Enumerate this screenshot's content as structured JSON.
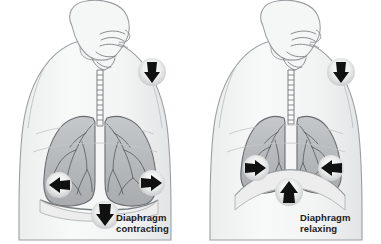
{
  "figure": {
    "background_color": "#ffffff"
  },
  "panels": [
    {
      "id": "inhalation",
      "caption_line1": "Diaphragm",
      "caption_line2": "contracting",
      "phase": "inhalation",
      "lung_state": "expanded",
      "diaphragm_state": "flattened / pulled down",
      "arrows": [
        {
          "name": "airflow-nose-arrow",
          "direction": "down",
          "meaning": "air flows in through nose and mouth"
        },
        {
          "name": "ribcage-left-arrow",
          "direction": "left",
          "meaning": "chest wall moves outward"
        },
        {
          "name": "ribcage-right-arrow",
          "direction": "right",
          "meaning": "chest wall moves outward"
        },
        {
          "name": "diaphragm-arrow",
          "direction": "down",
          "meaning": "diaphragm moves downward"
        }
      ]
    },
    {
      "id": "exhalation",
      "caption_line1": "Diaphragm",
      "caption_line2": "relaxing",
      "phase": "exhalation",
      "lung_state": "compressed",
      "diaphragm_state": "domed / pushed up",
      "arrows": [
        {
          "name": "airflow-nose-arrow",
          "direction": "down",
          "meaning": "air flows out through nose and mouth"
        },
        {
          "name": "ribcage-left-arrow",
          "direction": "right",
          "meaning": "chest wall moves inward"
        },
        {
          "name": "ribcage-right-arrow",
          "direction": "left",
          "meaning": "chest wall moves inward"
        },
        {
          "name": "diaphragm-arrow",
          "direction": "up",
          "meaning": "diaphragm moves upward"
        }
      ]
    }
  ],
  "colors": {
    "background": "#ffffff",
    "body_outline": "#8e9194",
    "body_fill": "#f3f4f5",
    "lung_fill": "#b9bcbe",
    "lung_outline": "#6a6d70",
    "bronchi": "#55585b",
    "arrow_fill": "#111111",
    "arrow_halo": "#e9eaeb",
    "caption_text": "#1a1a1a"
  }
}
